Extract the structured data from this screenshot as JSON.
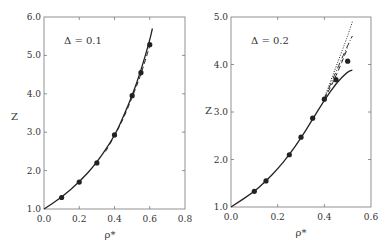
{
  "chart_data": [
    {
      "type": "line",
      "annotation": "Δ = 0.1",
      "xlabel": "ρ*",
      "ylabel": "Z",
      "xlim": [
        0.0,
        0.8
      ],
      "ylim": [
        1.0,
        6.0
      ],
      "xticks": [
        "0.0",
        "0.2",
        "0.4",
        "0.6",
        "0.8"
      ],
      "yticks": [
        "1.0",
        "2.0",
        "3.0",
        "4.0",
        "5.0",
        "6.0"
      ],
      "grid": false,
      "series": [
        {
          "name": "solid curve",
          "style": "solid",
          "x": [
            0.0,
            0.1,
            0.2,
            0.3,
            0.4,
            0.45,
            0.5,
            0.55,
            0.6,
            0.615
          ],
          "y": [
            1.0,
            1.3,
            1.7,
            2.2,
            2.9,
            3.4,
            3.95,
            4.6,
            5.4,
            5.7
          ]
        },
        {
          "name": "dashed curve",
          "style": "dashed",
          "x": [
            0.35,
            0.4,
            0.45,
            0.5,
            0.55,
            0.6
          ],
          "y": [
            2.5,
            2.9,
            3.35,
            3.9,
            4.5,
            5.25
          ]
        },
        {
          "name": "simulation points",
          "style": "markers",
          "x": [
            0.1,
            0.2,
            0.3,
            0.4,
            0.5,
            0.55,
            0.6
          ],
          "y": [
            1.3,
            1.7,
            2.2,
            2.93,
            3.95,
            4.55,
            5.28
          ]
        }
      ]
    },
    {
      "type": "line",
      "annotation": "Δ = 0.2",
      "xlabel": "ρ*",
      "ylabel": "Z",
      "xlim": [
        0.0,
        0.6
      ],
      "ylim": [
        1.0,
        5.0
      ],
      "xticks": [
        "0.0",
        "0.2",
        "0.4",
        "0.6"
      ],
      "yticks": [
        "1.0",
        "2.0",
        "3.0",
        "4.0",
        "5.0"
      ],
      "grid": false,
      "series": [
        {
          "name": "solid curve",
          "style": "solid",
          "x": [
            0.0,
            0.1,
            0.15,
            0.2,
            0.25,
            0.3,
            0.35,
            0.4,
            0.45,
            0.5,
            0.52
          ],
          "y": [
            1.0,
            1.32,
            1.55,
            1.8,
            2.1,
            2.45,
            2.85,
            3.25,
            3.6,
            3.85,
            3.88
          ]
        },
        {
          "name": "dashed curve",
          "style": "dashed",
          "x": [
            0.4,
            0.45,
            0.5
          ],
          "y": [
            3.27,
            3.75,
            4.35
          ]
        },
        {
          "name": "dash-dot curve",
          "style": "dashdot",
          "x": [
            0.4,
            0.45,
            0.5,
            0.52
          ],
          "y": [
            3.28,
            3.85,
            4.4,
            4.6
          ]
        },
        {
          "name": "dotted curve",
          "style": "dotted",
          "x": [
            0.4,
            0.45,
            0.5,
            0.52
          ],
          "y": [
            3.3,
            3.95,
            4.6,
            4.9
          ]
        },
        {
          "name": "simulation points",
          "style": "markers",
          "x": [
            0.1,
            0.15,
            0.25,
            0.3,
            0.35,
            0.4,
            0.45,
            0.5
          ],
          "y": [
            1.33,
            1.55,
            2.1,
            2.47,
            2.87,
            3.27,
            3.68,
            4.07
          ]
        }
      ]
    }
  ]
}
